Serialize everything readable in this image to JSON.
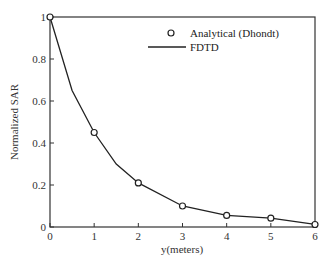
{
  "chart_data": {
    "type": "line",
    "title": "",
    "xlabel": "y(meters)",
    "ylabel": "Normalized SAR",
    "xlim": [
      0,
      6
    ],
    "ylim": [
      0,
      1
    ],
    "x_ticks": [
      0,
      1,
      2,
      3,
      4,
      5,
      6
    ],
    "y_ticks": [
      0,
      0.2,
      0.4,
      0.6,
      0.8,
      1
    ],
    "x_tick_labels": [
      "0",
      "1",
      "2",
      "3",
      "4",
      "5",
      "6"
    ],
    "y_tick_labels": [
      "0",
      "0.2",
      "0.4",
      "0.6",
      "0.8",
      "1"
    ],
    "grid": false,
    "legend_position": "upper right",
    "series": [
      {
        "name": "Analytical (Dhondt)",
        "style": "markers-open-circle",
        "x": [
          0,
          1,
          2,
          3,
          4,
          5,
          6
        ],
        "y": [
          1.0,
          0.45,
          0.21,
          0.1,
          0.055,
          0.042,
          0.012
        ]
      },
      {
        "name": "FDTD",
        "style": "solid-line",
        "x": [
          0,
          0.5,
          1,
          1.5,
          2,
          3,
          4,
          5,
          6
        ],
        "y": [
          1.0,
          0.65,
          0.45,
          0.3,
          0.21,
          0.1,
          0.055,
          0.042,
          0.012
        ]
      }
    ]
  },
  "legend": {
    "items": [
      {
        "label": "Analytical (Dhondt)",
        "symbol": "open-circle"
      },
      {
        "label": "FDTD",
        "symbol": "line"
      }
    ]
  },
  "colors": {
    "line": "#222222",
    "axis": "#333333",
    "marker_fill": "#ffffff"
  }
}
